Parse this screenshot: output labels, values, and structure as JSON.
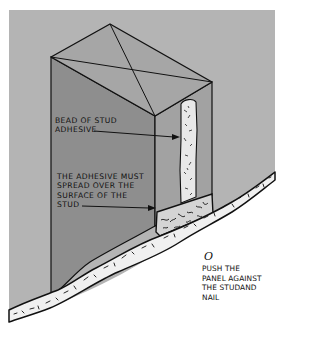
{
  "figure": {
    "type": "technical-illustration",
    "colors": {
      "background_gray": "#b4b4b4",
      "box_top": "#a6a6a6",
      "box_front": "#8e8e8e",
      "box_right": "#a2a2a2",
      "adhesive": "#e8e8e8",
      "panel": "#f0f0f0",
      "page": "#ffffff",
      "ink": "#111111"
    }
  },
  "labels": {
    "bead": "BEAD OF STUD\nADHESIVE",
    "spread": "THE ADHESIVE MUST\nSPREAD OVER THE\nSURFACE OF THE\nSTUD",
    "push": "PUSH THE\nPANEL AGAINST\nTHE STUDAND\nNAIL",
    "nail_mark": "O"
  }
}
